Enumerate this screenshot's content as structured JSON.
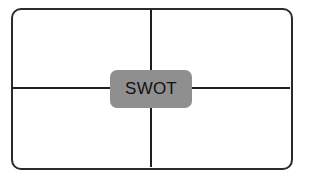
{
  "diagram": {
    "type": "swot-matrix",
    "center_label": "SWOT",
    "quadrants": [
      {
        "position": "top-left",
        "label": ""
      },
      {
        "position": "top-right",
        "label": ""
      },
      {
        "position": "bottom-left",
        "label": ""
      },
      {
        "position": "bottom-right",
        "label": ""
      }
    ],
    "colors": {
      "border": "#2b2b2b",
      "lines": "#1e1e1e",
      "center_fill": "#8f8f8f",
      "background": "#ffffff"
    }
  }
}
